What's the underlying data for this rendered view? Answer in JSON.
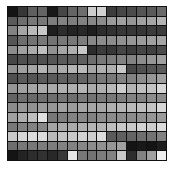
{
  "chart_data": {
    "type": "heatmap",
    "rows": 16,
    "cols": 16,
    "colormap": "grayscale",
    "values": [
      [
        20,
        55,
        95,
        100,
        25,
        70,
        100,
        110,
        205,
        210,
        60,
        70,
        75,
        85,
        90,
        105
      ],
      [
        90,
        110,
        120,
        120,
        125,
        130,
        125,
        130,
        135,
        140,
        155,
        160,
        150,
        160,
        165,
        180
      ],
      [
        130,
        165,
        185,
        200,
        30,
        45,
        35,
        40,
        30,
        45,
        50,
        55,
        55,
        55,
        60,
        60
      ],
      [
        85,
        110,
        115,
        120,
        115,
        120,
        120,
        125,
        135,
        140,
        140,
        145,
        150,
        155,
        160,
        165
      ],
      [
        140,
        160,
        170,
        190,
        145,
        165,
        175,
        200,
        45,
        60,
        55,
        70,
        60,
        70,
        65,
        75
      ],
      [
        70,
        80,
        80,
        80,
        85,
        90,
        90,
        95,
        110,
        120,
        125,
        130,
        130,
        140,
        150,
        160
      ],
      [
        145,
        160,
        165,
        180,
        160,
        170,
        180,
        185,
        165,
        175,
        175,
        200,
        70,
        80,
        85,
        90
      ],
      [
        80,
        90,
        85,
        90,
        90,
        95,
        95,
        100,
        110,
        120,
        120,
        130,
        130,
        140,
        150,
        160
      ],
      [
        150,
        160,
        165,
        170,
        170,
        175,
        175,
        180,
        170,
        175,
        185,
        205,
        180,
        190,
        195,
        215
      ],
      [
        100,
        110,
        105,
        110,
        110,
        115,
        110,
        120,
        115,
        120,
        120,
        125,
        130,
        130,
        140,
        140
      ],
      [
        140,
        150,
        145,
        155,
        150,
        160,
        155,
        165,
        165,
        165,
        175,
        180,
        185,
        190,
        195,
        215
      ],
      [
        160,
        175,
        190,
        225,
        120,
        125,
        130,
        135,
        130,
        140,
        140,
        140,
        140,
        145,
        150,
        155
      ],
      [
        120,
        130,
        130,
        135,
        165,
        170,
        170,
        175,
        180,
        180,
        190,
        200,
        200,
        210,
        205,
        220
      ],
      [
        200,
        215,
        220,
        220,
        185,
        195,
        200,
        210,
        205,
        220,
        90,
        95,
        100,
        110,
        115,
        130
      ],
      [
        110,
        120,
        120,
        125,
        125,
        130,
        130,
        135,
        140,
        145,
        150,
        160,
        20,
        25,
        20,
        30
      ],
      [
        20,
        35,
        45,
        50,
        40,
        55,
        230,
        120,
        115,
        125,
        130,
        200,
        45,
        130,
        160,
        240
      ]
    ],
    "title": "",
    "xlabel": "",
    "ylabel": "",
    "legend": "none",
    "grid": true
  }
}
